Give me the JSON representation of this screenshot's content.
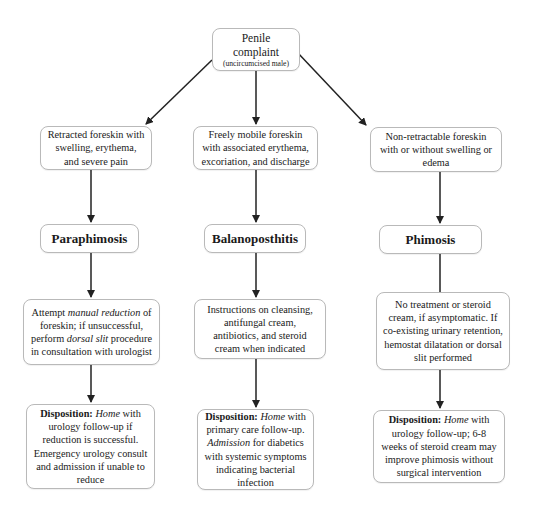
{
  "root": {
    "title": "Penile complaint",
    "subtitle": "(uncircumcised male)"
  },
  "columns": [
    {
      "presentation": "Retracted foreskin with swelling, erythema, and severe pain",
      "diagnosis": "Paraphimosis",
      "treatment": {
        "t1": "Attempt ",
        "t2": "manual reduction",
        "t3": " of foreskin; if unsuccessful, perform ",
        "t4": "dorsal slit",
        "t5": " procedure in consultation with urologist"
      },
      "disposition": {
        "label": "Disposition:",
        "em1": "Home",
        "text1": " with urology follow-up if reduction is successful. Emergency urology consult and admission if unable to reduce"
      }
    },
    {
      "presentation": "Freely mobile foreskin with associated erythema, excoriation, and discharge",
      "diagnosis": "Balanoposthitis",
      "treatment": {
        "t1": "Instructions on cleansing, antifungal cream, antibiotics, and steroid cream when indicated"
      },
      "disposition": {
        "label": "Disposition:",
        "em1": "Home",
        "text1": " with primary care follow-up. ",
        "em2": "Admission",
        "text2": " for diabetics with systemic symptoms indicating bacterial infection"
      }
    },
    {
      "presentation": "Non-retractable foreskin with or without swelling or edema",
      "diagnosis": "Phimosis",
      "treatment": {
        "t1": "No treatment or steroid cream, if asymptomatic. If co-existing urinary retention, hemostat dilatation or dorsal slit performed"
      },
      "disposition": {
        "label": "Disposition:",
        "em1": "Home",
        "text1": " with urology follow-up; 6-8 weeks of steroid cream may improve phimosis without surgical intervention"
      }
    }
  ],
  "colors": {
    "border": "#b9b9b9",
    "arrow": "#222222",
    "text": "#1a1a1a"
  }
}
